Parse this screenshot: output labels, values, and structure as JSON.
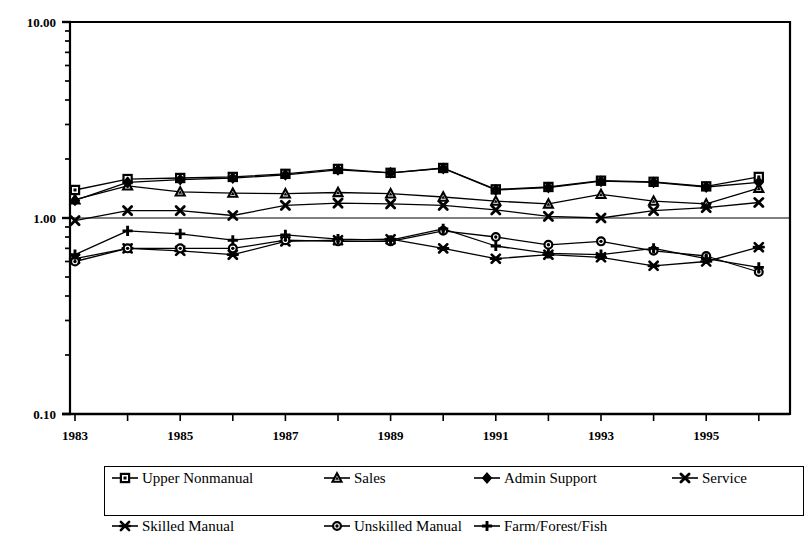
{
  "chart_data": {
    "type": "line",
    "title": "",
    "subtitle": "",
    "xlabel": "",
    "ylabel": "",
    "yscale": "log",
    "ylim": [
      0.1,
      10.0
    ],
    "xlim": [
      1983,
      1996
    ],
    "grid": false,
    "gridline_at": 1.0,
    "legend_position": "bottom",
    "y_tick_labels": [
      "10.00",
      "1.00",
      "0.10"
    ],
    "y_tick_values": [
      10.0,
      1.0,
      0.1
    ],
    "x_tick_labels": [
      "1983",
      "1985",
      "1987",
      "1989",
      "1991",
      "1993",
      "1995"
    ],
    "x_tick_values": [
      1983,
      1985,
      1987,
      1989,
      1991,
      1993,
      1995
    ],
    "x": [
      1983,
      1984,
      1985,
      1986,
      1987,
      1988,
      1989,
      1990,
      1991,
      1992,
      1993,
      1994,
      1995,
      1996
    ],
    "series": [
      {
        "name": "Upper Nonmanual",
        "marker": "square-open",
        "values": [
          1.39,
          1.58,
          1.6,
          1.62,
          1.68,
          1.78,
          1.7,
          1.8,
          1.4,
          1.44,
          1.55,
          1.53,
          1.45,
          1.62
        ]
      },
      {
        "name": "Sales",
        "marker": "triangle-open",
        "values": [
          1.24,
          1.46,
          1.36,
          1.34,
          1.33,
          1.35,
          1.33,
          1.28,
          1.22,
          1.18,
          1.32,
          1.22,
          1.18,
          1.42
        ]
      },
      {
        "name": "Admin Support",
        "marker": "diamond-filled",
        "values": [
          1.23,
          1.52,
          1.57,
          1.6,
          1.66,
          1.76,
          1.7,
          1.79,
          1.39,
          1.43,
          1.54,
          1.52,
          1.44,
          1.52
        ]
      },
      {
        "name": "Service",
        "marker": "x-cross",
        "values": [
          0.97,
          1.09,
          1.09,
          1.03,
          1.16,
          1.19,
          1.18,
          1.16,
          1.1,
          1.02,
          1.0,
          1.09,
          1.13,
          1.2
        ]
      },
      {
        "name": "Skilled Manual",
        "marker": "star-filled",
        "values": [
          0.62,
          0.7,
          0.68,
          0.65,
          0.76,
          0.77,
          0.78,
          0.7,
          0.62,
          0.65,
          0.63,
          0.57,
          0.6,
          0.71
        ]
      },
      {
        "name": "Unskilled Manual",
        "marker": "circle-filled",
        "values": [
          0.6,
          0.7,
          0.7,
          0.7,
          0.77,
          0.76,
          0.76,
          0.86,
          0.8,
          0.73,
          0.76,
          0.68,
          0.64,
          0.53
        ]
      },
      {
        "name": "Farm/Forest/Fish",
        "marker": "plus-cross",
        "values": [
          0.65,
          0.86,
          0.83,
          0.77,
          0.82,
          0.78,
          0.77,
          0.88,
          0.72,
          0.66,
          0.65,
          0.7,
          0.62,
          0.56
        ]
      }
    ]
  },
  "legend": {
    "rows": [
      [
        {
          "label": "Upper Nonmanual",
          "marker": "square-open"
        },
        {
          "label": "Sales",
          "marker": "triangle-open"
        },
        {
          "label": "Admin Support",
          "marker": "diamond-filled"
        },
        {
          "label": "Service",
          "marker": "x-cross"
        }
      ],
      [
        {
          "label": "Skilled Manual",
          "marker": "star-filled"
        },
        {
          "label": "Unskilled Manual",
          "marker": "circle-filled"
        },
        {
          "label": "Farm/Forest/Fish",
          "marker": "plus-cross"
        }
      ]
    ]
  },
  "colors": {
    "line": "#000000",
    "axis": "#000000",
    "background": "#ffffff"
  }
}
